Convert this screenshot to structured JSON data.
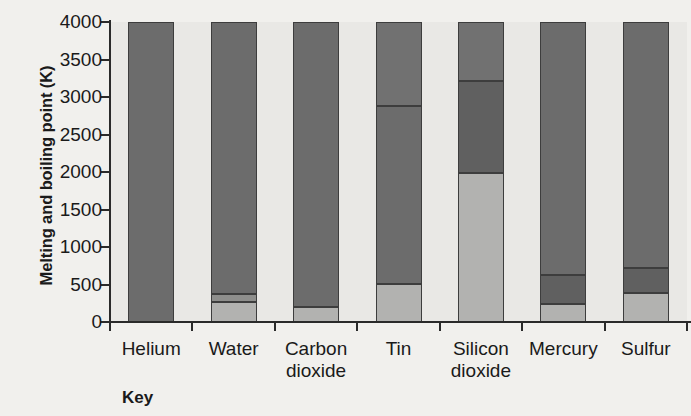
{
  "chart_data": {
    "type": "bar",
    "subtype": "stacked-bar",
    "title": "",
    "xlabel": "",
    "ylabel": "Melting and boiling point (K)",
    "ylim": [
      0,
      4000
    ],
    "yticks": [
      0,
      500,
      1000,
      1500,
      2000,
      2500,
      3000,
      3500,
      4000
    ],
    "ytick_labels": [
      "0",
      "500",
      "1000",
      "1500",
      "2000",
      "2500",
      "3000",
      "3500",
      "4000"
    ],
    "grid": false,
    "legend_position": "below-plot",
    "categories": [
      "Helium",
      "Water",
      "Carbon dioxide",
      "Tin",
      "Silicon dioxide",
      "Mercury",
      "Sulfur"
    ],
    "category_labels_wrapped": [
      "Helium",
      "Water",
      "Carbon\ndioxide",
      "Tin",
      "Silicon\ndioxide",
      "Mercury",
      "Sulfur"
    ],
    "series": [
      {
        "name": "melting point",
        "color": "#b2b2b0",
        "values": [
          1,
          273,
          195,
          505,
          1986,
          234,
          388
        ]
      },
      {
        "name": "boiling point",
        "color": "#6c6c6c",
        "values": [
          4,
          373,
          195,
          2875,
          3220,
          630,
          718
        ]
      }
    ],
    "bars": [
      {
        "category": "Helium",
        "segments": [
          {
            "from": 0,
            "to": 4000,
            "color": "#6c6c6c",
            "series": "boiling point"
          }
        ]
      },
      {
        "category": "Water",
        "segments": [
          {
            "from": 0,
            "to": 273,
            "color": "#b2b2b0",
            "series": "melting point"
          },
          {
            "from": 273,
            "to": 373,
            "color": "#8e8e8c",
            "series": "boiling point"
          },
          {
            "from": 373,
            "to": 4000,
            "color": "#6c6c6c",
            "series": "above boiling"
          }
        ]
      },
      {
        "category": "Carbon dioxide",
        "segments": [
          {
            "from": 0,
            "to": 195,
            "color": "#b2b2b0",
            "series": "melting point"
          },
          {
            "from": 195,
            "to": 4000,
            "color": "#6c6c6c",
            "series": "boiling point"
          }
        ]
      },
      {
        "category": "Tin",
        "segments": [
          {
            "from": 0,
            "to": 505,
            "color": "#b2b2b0",
            "series": "melting point"
          },
          {
            "from": 505,
            "to": 2875,
            "color": "#6c6c6c",
            "series": "boiling point"
          },
          {
            "from": 2875,
            "to": 4000,
            "color": "#717171",
            "series": "above boiling"
          }
        ]
      },
      {
        "category": "Silicon dioxide",
        "segments": [
          {
            "from": 0,
            "to": 1986,
            "color": "#b2b2b0",
            "series": "melting point"
          },
          {
            "from": 1986,
            "to": 3220,
            "color": "#606060",
            "series": "boiling point"
          },
          {
            "from": 3220,
            "to": 4000,
            "color": "#717171",
            "series": "above boiling"
          }
        ]
      },
      {
        "category": "Mercury",
        "segments": [
          {
            "from": 0,
            "to": 234,
            "color": "#b2b2b0",
            "series": "melting point"
          },
          {
            "from": 234,
            "to": 630,
            "color": "#606060",
            "series": "boiling point"
          },
          {
            "from": 630,
            "to": 4000,
            "color": "#6c6c6c",
            "series": "above boiling"
          }
        ]
      },
      {
        "category": "Sulfur",
        "segments": [
          {
            "from": 0,
            "to": 388,
            "color": "#b2b2b0",
            "series": "melting point"
          },
          {
            "from": 388,
            "to": 718,
            "color": "#606060",
            "series": "boiling point"
          },
          {
            "from": 718,
            "to": 4000,
            "color": "#6c6c6c",
            "series": "above boiling"
          }
        ]
      }
    ]
  },
  "key": {
    "label": "Key"
  },
  "colors": {
    "dark_gray": "#6c6c6c",
    "mid_gray": "#8e8e8c",
    "light_gray": "#b2b2b0",
    "plot_background": "#e9e8e5",
    "page_background": "#f1f0ed",
    "axis": "#2a2a2a",
    "text": "#1a1a1a"
  }
}
